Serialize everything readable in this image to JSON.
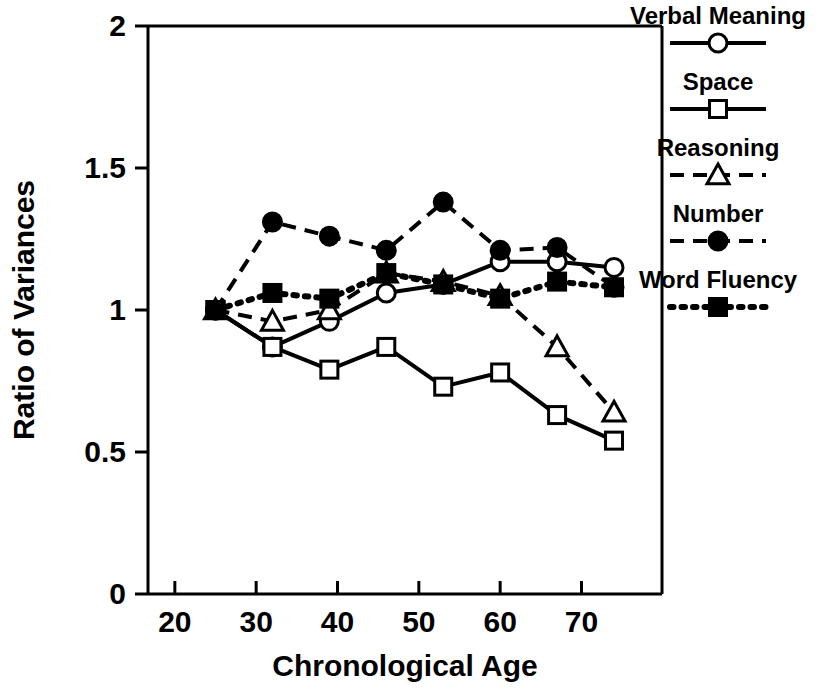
{
  "chart_data": {
    "type": "line",
    "title": "",
    "xlabel": "Chronological Age",
    "ylabel": "Ratio of Variances",
    "xlim": [
      16.7,
      79.9
    ],
    "ylim": [
      0,
      2
    ],
    "xticks": [
      20,
      30,
      40,
      50,
      60,
      70
    ],
    "xtick_labels": [
      "20",
      "30",
      "40",
      "50",
      "60",
      "70"
    ],
    "yticks": [
      0,
      0.5,
      1,
      1.5,
      2
    ],
    "ytick_labels": [
      "0",
      "0.5",
      "1",
      "1.5",
      "2"
    ],
    "grid": false,
    "legend_position": "right",
    "x": [
      25,
      32,
      39,
      46,
      53,
      60,
      67,
      74
    ],
    "series": [
      {
        "name": "Verbal Meaning",
        "marker": "open-circle",
        "linestyle": "solid",
        "values": [
          1.0,
          0.87,
          0.96,
          1.06,
          1.09,
          1.17,
          1.17,
          1.15
        ]
      },
      {
        "name": "Space",
        "marker": "open-square",
        "linestyle": "solid",
        "values": [
          1.0,
          0.87,
          0.79,
          0.87,
          0.73,
          0.78,
          0.63,
          0.54
        ]
      },
      {
        "name": "Reasoning",
        "marker": "open-triangle",
        "linestyle": "dashed",
        "values": [
          1.0,
          0.96,
          1.0,
          1.13,
          1.1,
          1.05,
          0.87,
          0.64
        ]
      },
      {
        "name": "Number",
        "marker": "filled-circle",
        "linestyle": "dashed",
        "values": [
          1.0,
          1.31,
          1.26,
          1.21,
          1.38,
          1.21,
          1.22,
          1.08
        ]
      },
      {
        "name": "Word Fluency",
        "marker": "filled-square",
        "linestyle": "dotted",
        "values": [
          1.0,
          1.06,
          1.04,
          1.13,
          1.09,
          1.04,
          1.1,
          1.08
        ]
      }
    ]
  },
  "legend": {
    "items": [
      {
        "label": "Verbal Meaning"
      },
      {
        "label": "Space"
      },
      {
        "label": "Reasoning"
      },
      {
        "label": "Number"
      },
      {
        "label": "Word Fluency"
      }
    ]
  },
  "colors": {
    "foreground": "#000000",
    "background": "#ffffff"
  }
}
